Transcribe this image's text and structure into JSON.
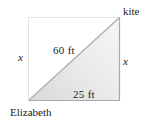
{
  "figure": {
    "labels": {
      "top_right": "kite",
      "bottom_left": "Elizabeth",
      "left_side": "x",
      "right_side": "x",
      "hypotenuse": "60 ft",
      "base": "25 ft"
    },
    "colors": {
      "square_dotted": "#c8c8c8",
      "triangle_edge": "#a8a8a8",
      "hypotenuse": "#b4b4b4",
      "fill_light": "#f4f4f4",
      "fill_dark": "#d6d6d6",
      "text": "#222222"
    }
  }
}
